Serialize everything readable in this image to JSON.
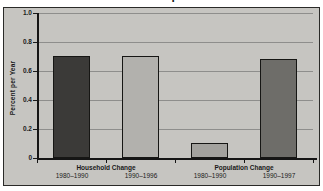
{
  "title": {
    "text": "Households and Population Growth"
  },
  "chart": {
    "y_axis_title": "Percent per Year",
    "y_tick_labels": [
      "1.0",
      "0.8",
      "0.6",
      "0.4",
      "0.2",
      "0"
    ],
    "groups": [
      {
        "label": "Household Change",
        "bars": [
          {
            "period": "1980–1990",
            "value": 0.7,
            "color": "#3b3a38"
          },
          {
            "period": "1990–1996",
            "value": 0.7,
            "color": "#b2b1ad"
          }
        ]
      },
      {
        "label": "Population Change",
        "bars": [
          {
            "period": "1980–1990",
            "value": 0.1,
            "color": "#a3a29e"
          },
          {
            "period": "1990–1997",
            "value": 0.68,
            "color": "#6e6d69"
          }
        ]
      }
    ],
    "colors": {
      "panel_bg": "#c6c5c1",
      "gridline": "#8e8e8c",
      "axis": "#151515",
      "text": "#1a1a1a"
    }
  },
  "chart_data": {
    "type": "bar",
    "title": "Households and Population Growth",
    "xlabel": "",
    "ylabel": "Percent per Year",
    "ylim": [
      0,
      1.0
    ],
    "grid": true,
    "legend_position": "none",
    "categories": [
      "Household Change 1980–1990",
      "Household Change 1990–1996",
      "Population Change 1980–1990",
      "Population Change 1990–1997"
    ],
    "values": [
      0.7,
      0.7,
      0.1,
      0.68
    ],
    "bar_colors": [
      "#3b3a38",
      "#b2b1ad",
      "#a3a29e",
      "#6e6d69"
    ],
    "group_labels": [
      "Household Change",
      "Population Change"
    ],
    "y_tick_labels": [
      "1.0",
      "0.8",
      "0.6",
      "0.4",
      "0.2",
      "0"
    ]
  }
}
